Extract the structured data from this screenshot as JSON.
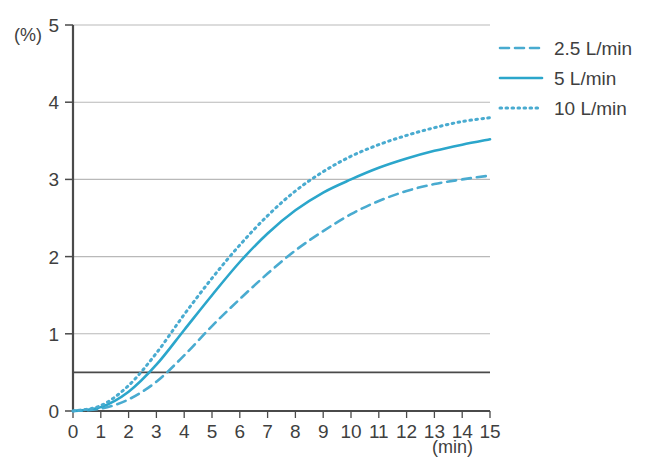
{
  "chart_data": {
    "type": "line",
    "title": "",
    "subtitle": "",
    "xlabel": "(min)",
    "ylabel": "(%)",
    "xlim": [
      0,
      15
    ],
    "ylim": [
      0,
      5
    ],
    "grid": true,
    "grid_axis": "y",
    "legend_position": "top-right",
    "x": [
      0,
      1,
      2,
      3,
      4,
      5,
      6,
      7,
      8,
      9,
      10,
      11,
      12,
      13,
      14,
      15
    ],
    "x_tick_labels": [
      "0",
      "1",
      "2",
      "3",
      "4",
      "5",
      "6",
      "7",
      "8",
      "9",
      "10",
      "11",
      "12",
      "13",
      "14",
      "15"
    ],
    "y_tick_labels": [
      "0",
      "1",
      "2",
      "3",
      "4",
      "5"
    ],
    "y_ticks": [
      0,
      1,
      2,
      3,
      4,
      5
    ],
    "series": [
      {
        "name": "2.5 L/min",
        "style": "dashed",
        "color": "#49ABD0",
        "values": [
          0,
          0.03,
          0.15,
          0.38,
          0.72,
          1.1,
          1.45,
          1.78,
          2.08,
          2.33,
          2.55,
          2.72,
          2.85,
          2.94,
          3.0,
          3.05
        ]
      },
      {
        "name": "5 L/min",
        "style": "solid",
        "color": "#2BA6CB",
        "values": [
          0,
          0.05,
          0.25,
          0.6,
          1.05,
          1.5,
          1.93,
          2.3,
          2.6,
          2.83,
          3.0,
          3.15,
          3.27,
          3.37,
          3.45,
          3.52
        ]
      },
      {
        "name": "10 L/min",
        "style": "dotted",
        "color": "#49ABD0",
        "values": [
          0,
          0.07,
          0.33,
          0.75,
          1.25,
          1.72,
          2.15,
          2.53,
          2.85,
          3.1,
          3.3,
          3.45,
          3.57,
          3.67,
          3.75,
          3.8
        ]
      }
    ],
    "annotations": [
      {
        "type": "hline",
        "value": 0.5,
        "color": "#4a4a4a",
        "label": ""
      }
    ],
    "colors": {
      "line_accent": "#2BA6CB",
      "grid": "#b9b9b9",
      "axis": "#4a4a4a",
      "threshold_line": "#4a4a4a",
      "text": "#3f3f3f",
      "background": "#ffffff"
    }
  },
  "legend": {
    "items": [
      {
        "label": "2.5 L/min",
        "style": "dashed"
      },
      {
        "label": "5 L/min",
        "style": "solid"
      },
      {
        "label": "10 L/min",
        "style": "dotted"
      }
    ]
  },
  "axes": {
    "y_unit": "(%)",
    "x_unit": "(min)"
  }
}
